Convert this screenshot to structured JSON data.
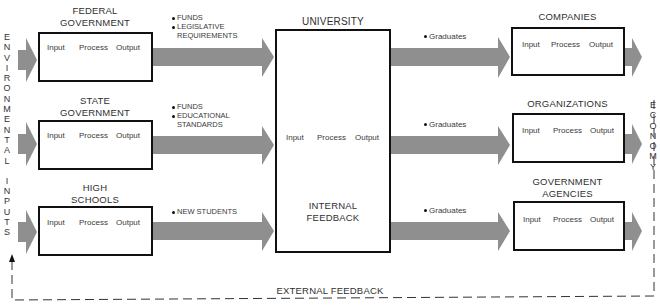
{
  "left_label": "ENVIRONMENTAL INPUTS",
  "left_letters": [
    "E",
    "N",
    "V",
    "I",
    "R",
    "O",
    "N",
    "M",
    "E",
    "N",
    "T",
    "A",
    "L",
    "",
    "I",
    "N",
    "P",
    "U",
    "T",
    "S"
  ],
  "right_label": "ECONOMY",
  "right_letters": [
    "E",
    "C",
    "O",
    "N",
    "O",
    "M",
    "Y"
  ],
  "colors": {
    "arrow": "#8f8f8f",
    "box_border": "#111111",
    "text": "#2f2f2f"
  },
  "inputs": [
    {
      "title_lines": [
        "FEDERAL",
        "GOVERNMENT"
      ],
      "ipo": [
        "Input",
        "Process",
        "Output"
      ],
      "flow_items": [
        {
          "text": "FUNDS"
        },
        {
          "text": "LEGISLATIVE",
          "cont": "REQUIREMENTS"
        }
      ]
    },
    {
      "title_lines": [
        "STATE",
        "GOVERNMENT"
      ],
      "ipo": [
        "Input",
        "Process",
        "Output"
      ],
      "flow_items": [
        {
          "text": "FUNDS"
        },
        {
          "text": "EDUCATIONAL",
          "cont": "STANDARDS"
        }
      ]
    },
    {
      "title_lines": [
        "HIGH",
        "SCHOOLS"
      ],
      "ipo": [
        "Input",
        "Process",
        "Output"
      ],
      "flow_items": [
        {
          "text": "NEW STUDENTS"
        }
      ]
    }
  ],
  "university": {
    "title": "UNIVERSITY",
    "ipo": [
      "Input",
      "Process",
      "Output"
    ],
    "internal_feedback": [
      "INTERNAL",
      "FEEDBACK"
    ]
  },
  "outputs": [
    {
      "title_lines": [
        "COMPANIES"
      ],
      "ipo": [
        "Input",
        "Process",
        "Output"
      ],
      "flow_item": "Graduates"
    },
    {
      "title_lines": [
        "ORGANIZATIONS"
      ],
      "ipo": [
        "Input",
        "Process",
        "Output"
      ],
      "flow_item": "Graduates"
    },
    {
      "title_lines": [
        "GOVERNMENT",
        "AGENCIES"
      ],
      "ipo": [
        "Input",
        "Process",
        "Output"
      ],
      "flow_item": "Graduates"
    }
  ],
  "external_feedback": "EXTERNAL FEEDBACK"
}
